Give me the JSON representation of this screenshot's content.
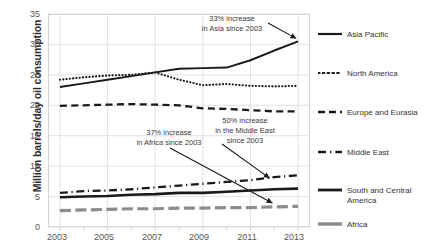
{
  "chart_data": {
    "type": "line",
    "title": "",
    "xlabel": "",
    "ylabel": "Million barrels/day oil consumption",
    "x": [
      2003,
      2004,
      2005,
      2006,
      2007,
      2008,
      2009,
      2010,
      2011,
      2012,
      2013
    ],
    "xlim": [
      2002.5,
      2013.5
    ],
    "ylim": [
      0,
      35
    ],
    "xticks": [
      "2003",
      "2005",
      "2007",
      "2009",
      "2011",
      "2013"
    ],
    "yticks": [
      "0",
      "5",
      "10",
      "15",
      "20",
      "25",
      "30",
      "35"
    ],
    "grid": true,
    "legend_position": "right",
    "series": [
      {
        "name": "Asia Pacific",
        "style": "solid",
        "color": "#1a1a1a",
        "values": [
          23.0,
          23.6,
          24.2,
          24.8,
          25.4,
          26.0,
          26.1,
          26.2,
          27.4,
          29.0,
          30.5
        ]
      },
      {
        "name": "North America",
        "style": "dotted",
        "color": "#1a1a1a",
        "values": [
          24.2,
          24.6,
          24.9,
          25.0,
          25.4,
          24.2,
          23.3,
          23.5,
          23.2,
          23.1,
          23.2
        ]
      },
      {
        "name": "Europe and Eurasia",
        "style": "dashed",
        "color": "#1a1a1a",
        "values": [
          19.9,
          20.0,
          20.1,
          20.2,
          20.1,
          20.0,
          19.5,
          19.4,
          19.2,
          19.0,
          19.0
        ]
      },
      {
        "name": "Middle East",
        "style": "dashdot",
        "color": "#1a1a1a",
        "values": [
          5.6,
          5.9,
          6.0,
          6.2,
          6.5,
          6.8,
          7.1,
          7.4,
          7.7,
          8.2,
          8.5
        ]
      },
      {
        "name": "South and Central America",
        "style": "solid-thick",
        "color": "#1a1a1a",
        "values": [
          4.9,
          5.0,
          5.1,
          5.3,
          5.4,
          5.6,
          5.6,
          5.8,
          6.0,
          6.2,
          6.3
        ]
      },
      {
        "name": "Africa",
        "style": "solid-gray",
        "color": "#8c8c8c",
        "values": [
          2.7,
          2.8,
          2.9,
          3.0,
          3.0,
          3.1,
          3.1,
          3.2,
          3.2,
          3.3,
          3.4
        ]
      }
    ],
    "annotations": [
      {
        "id": "asia",
        "lines": [
          "33% increase",
          "in Asia since 2003"
        ],
        "points_to": {
          "x": 2013,
          "y": 30.5
        }
      },
      {
        "id": "africa",
        "lines": [
          "37% increase",
          "in Africa since 2003"
        ],
        "points_to": {
          "x": 2012,
          "y": 3.3
        }
      },
      {
        "id": "middle-east",
        "lines": [
          "50% increase",
          "in the Middle East",
          "since 2003"
        ],
        "points_to": {
          "x": 2012,
          "y": 8.2
        }
      }
    ]
  },
  "legend": {
    "items": [
      {
        "label": "Asia Pacific",
        "key": "solid-line-key"
      },
      {
        "label": "North America",
        "key": "dotted-line-key"
      },
      {
        "label": "Europe and Eurasia",
        "key": "dashed-line-key"
      },
      {
        "label": "Middle East",
        "key": "dashdot-line-key"
      },
      {
        "label": "South and Central America",
        "key": "thick-solid-line-key"
      },
      {
        "label": "Africa",
        "key": "gray-solid-line-key"
      }
    ]
  },
  "axes": {
    "y_title": "Million barrels/day oil consumption",
    "y_ticks": [
      "35",
      "30",
      "25",
      "20",
      "15",
      "10",
      "5",
      "0"
    ],
    "x_ticks": [
      "2003",
      "2005",
      "2007",
      "2009",
      "2011",
      "2013"
    ]
  },
  "annotations": {
    "asia_line1": "33% increase",
    "asia_line2": "in Asia since 2003",
    "africa_line1": "37% increase",
    "africa_line2": "in Africa since 2003",
    "me_line1": "50% increase",
    "me_line2": "in the Middle East",
    "me_line3": "since 2003"
  }
}
